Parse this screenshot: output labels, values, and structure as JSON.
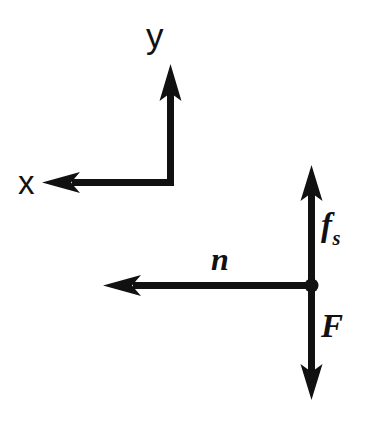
{
  "figure": {
    "kind": "free-body-diagram",
    "background_color": "#ffffff",
    "ink_color": "#111111",
    "stroke_width_px": 7,
    "axes": {
      "name": "coordinate-axes",
      "corner": {
        "x": 170,
        "y": 182
      },
      "y_axis": {
        "label": "y",
        "direction": "up",
        "tip": {
          "x": 170,
          "y": 65
        },
        "label_position": {
          "x": 146,
          "y": 18
        }
      },
      "x_axis": {
        "label": "x",
        "direction": "left",
        "tip": {
          "x": 42,
          "y": 182
        },
        "label_position": {
          "x": 18,
          "y": 166
        }
      }
    },
    "forces": {
      "origin": {
        "x": 311,
        "y": 285
      },
      "origin_dot_radius": 7,
      "vectors": [
        {
          "name": "static-friction-vector",
          "label": "f",
          "label_subscript": "s",
          "label_full": "fs",
          "direction": "up",
          "tip": {
            "x": 311,
            "y": 165
          },
          "length_px": 120,
          "label_position": {
            "x": 321,
            "y": 209
          }
        },
        {
          "name": "normal-force-vector",
          "label": "n",
          "label_subscript": "",
          "label_full": "n",
          "direction": "left",
          "tip": {
            "x": 103,
            "y": 285
          },
          "length_px": 208,
          "label_position": {
            "x": 211,
            "y": 243
          }
        },
        {
          "name": "applied-force-vector",
          "label": "F",
          "label_subscript": "",
          "label_full": "F",
          "direction": "down",
          "tip": {
            "x": 311,
            "y": 400
          },
          "length_px": 115,
          "label_position": {
            "x": 321,
            "y": 310
          }
        }
      ]
    }
  }
}
